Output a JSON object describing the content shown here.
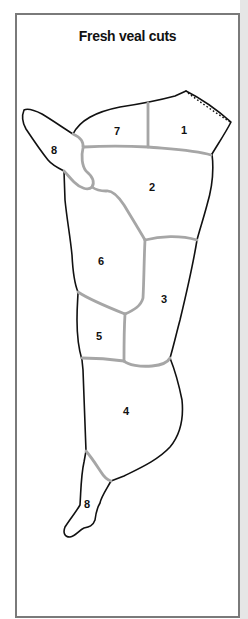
{
  "title": "Fresh veal cuts",
  "colors": {
    "frame": "#7a7a7a",
    "outline": "#111111",
    "divider": "#a6a6a6",
    "background": "#ffffff"
  },
  "cuts": [
    {
      "number": "1",
      "region": "top-right",
      "x": 184,
      "y": 134
    },
    {
      "number": "7",
      "region": "top-middle",
      "x": 117,
      "y": 135
    },
    {
      "number": "8",
      "region": "upper-shank",
      "x": 54,
      "y": 154
    },
    {
      "number": "2",
      "region": "upper-center",
      "x": 152,
      "y": 191
    },
    {
      "number": "6",
      "region": "middle-left",
      "x": 101,
      "y": 265
    },
    {
      "number": "3",
      "region": "middle-right",
      "x": 164,
      "y": 303
    },
    {
      "number": "5",
      "region": "lower-left",
      "x": 99,
      "y": 340
    },
    {
      "number": "4",
      "region": "lower-center",
      "x": 126,
      "y": 415
    },
    {
      "number": "8",
      "region": "lower-shank",
      "x": 87,
      "y": 508
    }
  ]
}
